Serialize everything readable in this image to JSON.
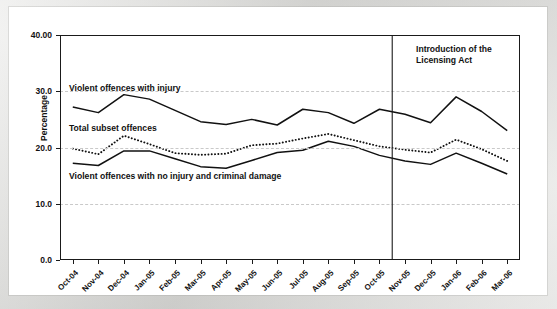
{
  "chart_data": {
    "type": "line",
    "title": "",
    "xlabel": "",
    "ylabel": "Percentage",
    "ylim": [
      0.0,
      40.0
    ],
    "grid": true,
    "grid_axis": "y",
    "legend": "inline-labels",
    "ytick_labels": [
      "0.0",
      "10.0",
      "20.0",
      "30.0",
      "40.00"
    ],
    "ytick_values": [
      0.0,
      10.0,
      20.0,
      30.0,
      40.0
    ],
    "categories": [
      "Oct-04",
      "Nov-04",
      "Dec-04",
      "Jan-05",
      "Feb-05",
      "Mar-05",
      "Apr-05",
      "May-05",
      "Jun-05",
      "Jul-05",
      "Aug-05",
      "Sep-05",
      "Oct-05",
      "Nov-05",
      "Dec-05",
      "Jan-06",
      "Feb-06",
      "Mar-06"
    ],
    "series": [
      {
        "name": "Violent offences with injury",
        "style": "solid",
        "color": "#111111",
        "values": [
          27.2,
          26.2,
          29.4,
          28.6,
          26.6,
          24.6,
          24.1,
          25.0,
          24.0,
          26.8,
          26.2,
          24.3,
          26.8,
          25.9,
          24.4,
          29.0,
          26.4,
          23.0
        ]
      },
      {
        "name": "Total subset offences",
        "style": "dotted",
        "color": "#111111",
        "values": [
          19.8,
          18.8,
          22.1,
          20.6,
          19.0,
          18.7,
          18.9,
          20.4,
          20.7,
          21.6,
          22.4,
          21.3,
          20.2,
          19.6,
          19.1,
          21.4,
          19.7,
          17.6
        ]
      },
      {
        "name": "Violent offences with no injury and criminal damage",
        "style": "solid",
        "color": "#111111",
        "values": [
          17.2,
          16.8,
          19.4,
          19.4,
          18.0,
          16.6,
          16.3,
          17.7,
          19.1,
          19.5,
          21.1,
          20.2,
          18.6,
          17.6,
          17.0,
          19.0,
          17.2,
          15.3
        ]
      }
    ],
    "annotations": [
      {
        "name": "licensing-act",
        "text_lines": [
          "Introduction of the",
          "Licensing Act"
        ],
        "vline_between": [
          "Oct-05",
          "Nov-05"
        ],
        "vline_x_value": 12.5
      }
    ],
    "series_inline_labels": [
      {
        "text": "Violent offences with injury",
        "x_px": 60,
        "y_px": 76
      },
      {
        "text": "Total subset offences",
        "x_px": 60,
        "y_px": 116
      },
      {
        "text": "Violent offences with no injury and criminal damage",
        "x_px": 60,
        "y_px": 164
      }
    ]
  },
  "axes": {
    "y_title": "Percentage"
  },
  "annotation": {
    "line1": "Introduction of the",
    "line2": "Licensing Act"
  }
}
